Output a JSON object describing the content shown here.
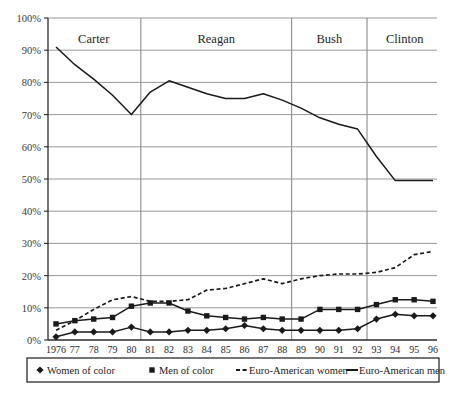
{
  "chart_data": {
    "type": "line",
    "title": "",
    "xlabel": "",
    "ylabel": "",
    "ylim": [
      0,
      100
    ],
    "y_unit": "%",
    "grid": true,
    "legend_position": "bottom",
    "x": [
      1976,
      1977,
      1978,
      1979,
      1980,
      1981,
      1982,
      1983,
      1984,
      1985,
      1986,
      1987,
      1988,
      1989,
      1990,
      1991,
      1992,
      1993,
      1994,
      1995,
      1996
    ],
    "categories": [
      "1976",
      "77",
      "78",
      "79",
      "80",
      "81",
      "82",
      "83",
      "84",
      "85",
      "86",
      "87",
      "88",
      "89",
      "90",
      "91",
      "92",
      "93",
      "94",
      "95",
      "96"
    ],
    "y_ticks": [
      "0%",
      "10%",
      "20%",
      "30%",
      "40%",
      "50%",
      "60%",
      "70%",
      "80%",
      "90%",
      "100%"
    ],
    "y_tick_values": [
      0,
      10,
      20,
      30,
      40,
      50,
      60,
      70,
      80,
      90,
      100
    ],
    "series": [
      {
        "name": "Women of color",
        "marker": "diamond",
        "style": "solid",
        "color": "#1a1a1a",
        "values": [
          1.0,
          2.5,
          2.5,
          2.5,
          4.0,
          2.5,
          2.5,
          3.0,
          3.0,
          3.5,
          4.5,
          3.5,
          3.0,
          3.0,
          3.0,
          3.0,
          3.5,
          6.5,
          8.0,
          7.5,
          7.5
        ]
      },
      {
        "name": "Men of color",
        "marker": "square",
        "style": "solid",
        "color": "#1a1a1a",
        "values": [
          5.0,
          6.0,
          6.5,
          7.0,
          10.5,
          11.5,
          11.5,
          9.0,
          7.5,
          7.0,
          6.5,
          7.0,
          6.5,
          6.5,
          9.5,
          9.5,
          9.5,
          11.0,
          12.5,
          12.5,
          12.0
        ]
      },
      {
        "name": "Euro-American women",
        "marker": "none",
        "style": "dashed",
        "color": "#1a1a1a",
        "values": [
          3.0,
          6.0,
          9.5,
          12.5,
          13.5,
          12.0,
          12.0,
          12.5,
          15.5,
          16.0,
          17.5,
          19.0,
          17.5,
          19.0,
          20.0,
          20.5,
          20.5,
          21.0,
          22.5,
          26.5,
          27.5
        ]
      },
      {
        "name": "Euro-American men",
        "marker": "none",
        "style": "solid",
        "color": "#1a1a1a",
        "values": [
          91.0,
          85.5,
          81.0,
          76.0,
          70.0,
          77.0,
          80.5,
          78.5,
          76.5,
          75.0,
          75.0,
          76.5,
          74.5,
          72.0,
          69.0,
          67.0,
          65.5,
          57.0,
          49.5,
          49.5,
          49.5
        ]
      }
    ],
    "annotations": [
      {
        "label": "Carter",
        "start_year": 1976,
        "end_year": 1980
      },
      {
        "label": "Reagan",
        "start_year": 1981,
        "end_year": 1988
      },
      {
        "label": "Bush",
        "start_year": 1989,
        "end_year": 1992
      },
      {
        "label": "Clinton",
        "start_year": 1993,
        "end_year": 1996
      }
    ],
    "era_divider_years": [
      1980.5,
      1988.5,
      1992.5
    ]
  },
  "legend": {
    "entries": [
      {
        "label": "Women of color",
        "marker": "diamond"
      },
      {
        "label": "Men of color",
        "marker": "square"
      },
      {
        "label": "Euro-American women",
        "marker": "dashed-line"
      },
      {
        "label": "Euro-American men",
        "marker": "solid-line"
      }
    ]
  }
}
